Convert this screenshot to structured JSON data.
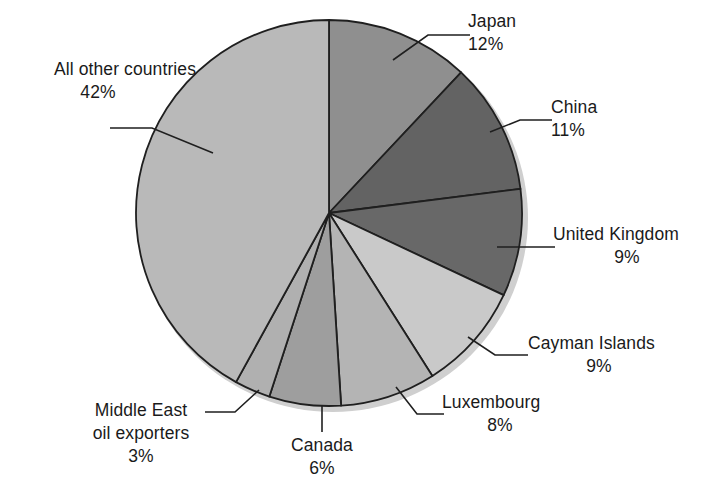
{
  "chart_data": {
    "type": "pie",
    "title": "",
    "subtitle": "",
    "xlabel": "",
    "ylabel": "",
    "legend_position": "none",
    "grid": false,
    "start_angle_deg": 0,
    "direction": "clockwise",
    "units": "percent",
    "categories": [
      "Japan",
      "China",
      "United Kingdom",
      "Cayman Islands",
      "Luxembourg",
      "Canada",
      "Middle East oil exporters",
      "All other countries"
    ],
    "values": [
      12,
      11,
      9,
      9,
      8,
      6,
      3,
      42
    ],
    "value_labels": [
      "12%",
      "11%",
      "9%",
      "9%",
      "8%",
      "6%",
      "3%",
      "42%"
    ],
    "colors": [
      "#8f8f8f",
      "#636363",
      "#686868",
      "#c9c9c9",
      "#b4b4b4",
      "#9e9e9e",
      "#b0b0b0",
      "#b9b9b9"
    ],
    "slice_outline_color": "#1f1f1f",
    "shadow_color": "#cfcfcf",
    "background_color": "#ffffff",
    "text_color": "#1a1a1a"
  },
  "labels": {
    "japan": {
      "name": "Japan",
      "pct": "12%"
    },
    "china": {
      "name": "China",
      "pct": "11%"
    },
    "united_kingdom": {
      "name": "United Kingdom",
      "pct": "9%"
    },
    "cayman_islands": {
      "name": "Cayman Islands",
      "pct": "9%"
    },
    "luxembourg": {
      "name": "Luxembourg",
      "pct": "8%"
    },
    "canada": {
      "name": "Canada",
      "pct": "6%"
    },
    "middle_east": {
      "name_line1": "Middle East",
      "name_line2": "oil exporters",
      "pct": "3%"
    },
    "all_other": {
      "name": "All other countries",
      "pct": "42%"
    }
  }
}
